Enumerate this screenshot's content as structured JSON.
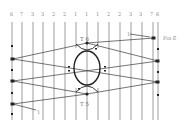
{
  "diagram": {
    "type": "bobbin lace thread diagram",
    "column_numbers": [
      "6",
      "7",
      "3",
      "3",
      "2",
      "2",
      "1",
      "1",
      "1",
      "2",
      "2",
      "3",
      "3",
      "7",
      "6"
    ],
    "column_x": [
      12,
      22,
      33,
      43,
      54,
      65,
      76,
      87,
      98,
      109,
      120,
      131,
      142,
      153,
      158
    ],
    "labels": {
      "top_tally": "T 6",
      "bottom_tally": "T 5",
      "pin": "Pin E",
      "thread_1_top": "1",
      "thread_1_bottom": "1"
    },
    "colors": {
      "line": "#4a4a4a",
      "text": "#8a8a8a",
      "background": "#ffffff"
    }
  }
}
